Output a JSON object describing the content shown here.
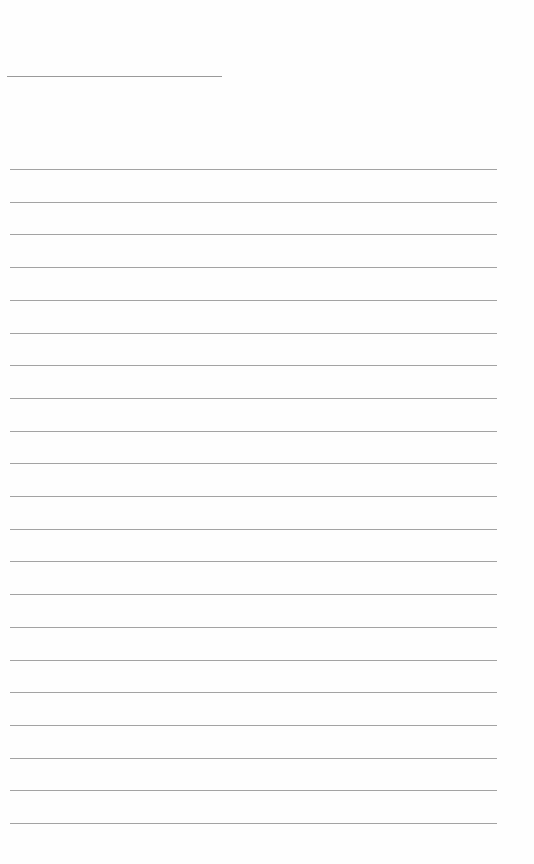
{
  "page": {
    "type": "lined-paper",
    "background_color": "#fefefe",
    "line_color": "#a3a3a3"
  },
  "header_line": {
    "x": 7,
    "y": 76,
    "width": 215
  },
  "rules": {
    "count": 21,
    "start_y": 169,
    "spacing": 32.7,
    "x": 10,
    "width": 487
  }
}
